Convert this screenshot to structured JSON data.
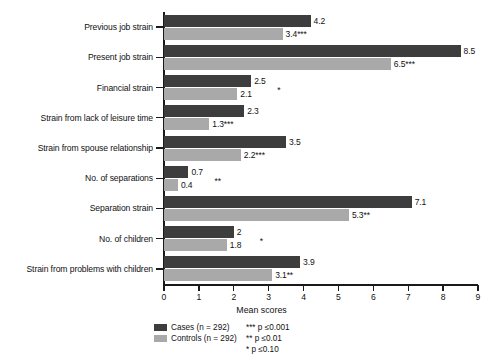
{
  "chart_data": {
    "type": "bar",
    "orientation": "horizontal",
    "title": "",
    "xlabel": "Mean scores",
    "ylabel": "",
    "xlim": [
      0,
      9
    ],
    "xticks": [
      "0",
      "1",
      "2",
      "3",
      "4",
      "5",
      "6",
      "7",
      "8",
      "9"
    ],
    "grid": false,
    "legend_position": "bottom-left",
    "categories": [
      "Previous job strain",
      "Present job strain",
      "Financial strain",
      "Strain from lack of leisure time",
      "Strain from spouse relationship",
      "No. of separations",
      "Separation strain",
      "No. of children",
      "Strain from problems with children"
    ],
    "series": [
      {
        "name": "Cases (n = 292)",
        "color": "#3d3d3d",
        "values": [
          4.2,
          8.5,
          2.5,
          2.3,
          3.5,
          0.7,
          7.1,
          2,
          3.9
        ],
        "labels": [
          "4.2",
          "8.5",
          "2.5",
          "2.3",
          "3.5",
          "0.7",
          "7.1",
          "2",
          "3.9"
        ]
      },
      {
        "name": "Controls (n = 292)",
        "color": "#a9a9a9",
        "values": [
          3.4,
          6.5,
          2.1,
          1.3,
          2.2,
          0.4,
          5.3,
          1.8,
          3.1
        ],
        "labels": [
          "3.4***",
          "6.5***",
          "2.1",
          "1.3***",
          "2.2***",
          "0.4",
          "5.3**",
          "1.8",
          "3.1**"
        ]
      }
    ],
    "floating_significance": [
      {
        "category": "Financial strain",
        "mark": "*"
      },
      {
        "category": "No. of separations",
        "mark": "**"
      },
      {
        "category": "No. of children",
        "mark": "*"
      }
    ]
  },
  "legend": {
    "items": [
      {
        "label": "Cases (n = 292)",
        "color": "#3d3d3d"
      },
      {
        "label": "Controls (n = 292)",
        "color": "#a9a9a9"
      }
    ]
  },
  "notes": [
    "*** p ≤0.001",
    "** p ≤0.01",
    "* p ≤0.10"
  ]
}
